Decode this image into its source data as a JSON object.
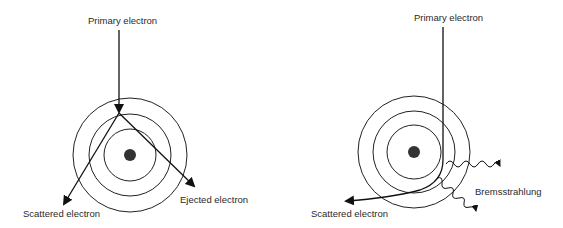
{
  "diagrams": [
    {
      "id": "inelastic-scattering",
      "labels": {
        "primary": "Primary electron",
        "scattered": "Scattered electron",
        "ejected": "Ejected electron"
      },
      "nucleus": {
        "cx": 130,
        "cy": 155
      },
      "shell_radii": [
        26,
        41,
        57
      ]
    },
    {
      "id": "bremsstrahlung",
      "labels": {
        "primary": "Primary electron",
        "scattered": "Scattered electron",
        "radiation": "Bremsstrahlung"
      },
      "nucleus": {
        "cx": 414,
        "cy": 152
      },
      "shell_radii": [
        27,
        41,
        56
      ]
    }
  ],
  "colors": {
    "stroke": "#1a1a1a",
    "nucleus": "#333333"
  }
}
